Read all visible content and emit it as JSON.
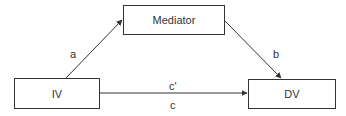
{
  "diagram": {
    "type": "mediation-model",
    "nodes": {
      "mediator": {
        "label": "Mediator"
      },
      "iv": {
        "label": "IV"
      },
      "dv": {
        "label": "DV"
      }
    },
    "edges": {
      "a": {
        "from": "IV",
        "to": "Mediator",
        "label": "a"
      },
      "b": {
        "from": "Mediator",
        "to": "DV",
        "label": "b"
      },
      "c_prime": {
        "from": "IV",
        "to": "DV",
        "label": "c'"
      },
      "c": {
        "from": "IV",
        "to": "DV",
        "label": "c"
      }
    },
    "colors": {
      "stroke": "#333333",
      "background": "#ffffff"
    }
  }
}
